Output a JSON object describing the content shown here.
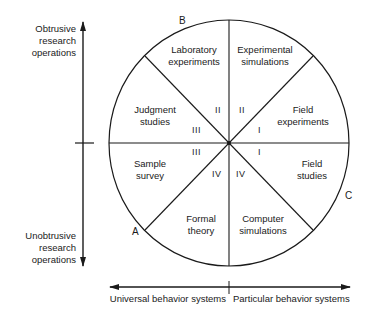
{
  "diagram": {
    "vertical_axis": {
      "top_label": [
        "Obtrusive",
        "research",
        "operations"
      ],
      "bottom_label": [
        "Unobtrusive",
        "research",
        "operations"
      ]
    },
    "horizontal_axis": {
      "left_label": "Universal behavior systems",
      "right_label": "Particular behavior systems"
    },
    "points": {
      "a": "A",
      "b": "B",
      "c": "C"
    },
    "sectors": [
      {
        "id": "laboratory-experiments",
        "lines": [
          "Laboratory",
          "experiments"
        ]
      },
      {
        "id": "experimental-simulations",
        "lines": [
          "Experimental",
          "simulations"
        ]
      },
      {
        "id": "field-experiments",
        "lines": [
          "Field",
          "experiments"
        ]
      },
      {
        "id": "field-studies",
        "lines": [
          "Field",
          "studies"
        ]
      },
      {
        "id": "computer-simulations",
        "lines": [
          "Computer",
          "simulations"
        ]
      },
      {
        "id": "formal-theory",
        "lines": [
          "Formal",
          "theory"
        ]
      },
      {
        "id": "sample-survey",
        "lines": [
          "Sample",
          "survey"
        ]
      },
      {
        "id": "judgment-studies",
        "lines": [
          "Judgment",
          "studies"
        ]
      }
    ],
    "quadrant_marks": {
      "upper_left_ii": "II",
      "upper_right_ii": "II",
      "left_iii_upper": "III",
      "left_iii_lower": "III",
      "right_i_upper": "I",
      "right_i_lower": "I",
      "lower_left_iv": "IV",
      "lower_right_iv": "IV"
    }
  }
}
